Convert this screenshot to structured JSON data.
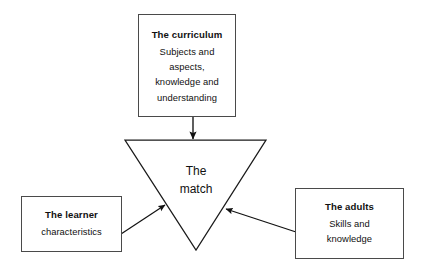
{
  "diagram": {
    "title_text": "The match",
    "nodes": {
      "curriculum": {
        "title": "The curriculum",
        "lines": [
          "Subjects and",
          "aspects,",
          "knowledge and",
          "understanding"
        ]
      },
      "learner": {
        "title": "The learner",
        "lines": [
          "characteristics"
        ]
      },
      "adults": {
        "title": "The adults",
        "lines": [
          "Skills and",
          "knowledge"
        ]
      },
      "center": {
        "line1": "The",
        "line2": "match"
      }
    },
    "connectors": [
      {
        "name": "curriculum-to-match",
        "from": "curriculum",
        "to": "match",
        "direction": "down"
      },
      {
        "name": "learner-to-match",
        "from": "learner",
        "to": "match",
        "direction": "up-right"
      },
      {
        "name": "adults-to-match",
        "from": "adults",
        "to": "match",
        "direction": "up-left"
      }
    ],
    "colors": {
      "background": "#ffffff",
      "box_border": "#4a4a4a",
      "triangle_stroke": "#1a1a1a",
      "connector": "#111111",
      "text": "#111111"
    }
  }
}
